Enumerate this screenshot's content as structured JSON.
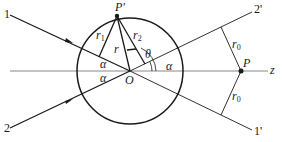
{
  "diagram": {
    "labels": {
      "ray_in_1": "1",
      "ray_in_2": "2",
      "ray_out_1": "1'",
      "ray_out_2": "2'",
      "point_p_prime": "P'",
      "point_p": "P",
      "center": "O",
      "axis": "z",
      "r1": "r",
      "r1_sub": "1",
      "r2": "r",
      "r2_sub": "2",
      "r": "r",
      "r0_upper": "r",
      "r0_upper_sub": "0",
      "r0_lower": "r",
      "r0_lower_sub": "0",
      "theta": "θ",
      "alpha_right": "α",
      "alpha_left_upper": "α",
      "alpha_left_lower": "α"
    },
    "colors": {
      "stroke": "#1a1a1a",
      "axis": "#777777",
      "background": "#ffffff"
    }
  }
}
